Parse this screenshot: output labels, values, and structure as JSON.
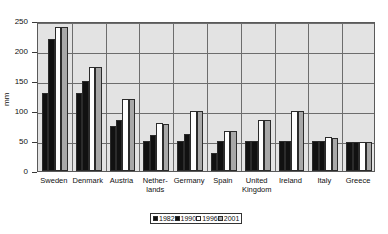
{
  "chart_data": {
    "type": "bar",
    "title": "",
    "xlabel": "",
    "ylabel": "mm",
    "ylim": [
      0,
      250
    ],
    "yticks": [
      0,
      50,
      100,
      150,
      200,
      250
    ],
    "grid": true,
    "legend_position": "bottom",
    "categories": [
      "Sweden",
      "Denmark",
      "Austria",
      "Netherlands",
      "Germany",
      "Spain",
      "United Kingdom",
      "Ireland",
      "Italy",
      "Greece"
    ],
    "category_labels": [
      [
        "Sweden"
      ],
      [
        "Denmark"
      ],
      [
        "Austria"
      ],
      [
        "Nether-",
        "lands"
      ],
      [
        "Germany"
      ],
      [
        "Spain"
      ],
      [
        "United",
        "Kingdom"
      ],
      [
        "Ireland"
      ],
      [
        "Italy"
      ],
      [
        "Greece"
      ]
    ],
    "series": [
      {
        "name": "1982",
        "color": "#111111",
        "values": [
          130,
          130,
          75,
          50,
          50,
          30,
          50,
          50,
          50,
          48
        ]
      },
      {
        "name": "1990",
        "color": "#111111",
        "values": [
          220,
          150,
          85,
          60,
          62,
          50,
          50,
          50,
          50,
          48
        ]
      },
      {
        "name": "1996",
        "color": "#ffffff",
        "values": [
          240,
          173,
          120,
          80,
          100,
          67,
          85,
          100,
          57,
          48
        ]
      },
      {
        "name": "2001",
        "color": "#a8a8a8",
        "values": [
          240,
          173,
          120,
          78,
          100,
          67,
          85,
          100,
          55,
          48
        ]
      }
    ]
  },
  "legend": {
    "entries": [
      {
        "label": "1982",
        "color": "#111111"
      },
      {
        "label": "1990",
        "color": "#111111"
      },
      {
        "label": "1996",
        "color": "#ffffff"
      },
      {
        "label": "2001",
        "color": "#a8a8a8"
      }
    ]
  },
  "colors": {
    "plot_background": "#e3e3e3",
    "gridline": "#6d6d6d",
    "axis": "#3a3a3a",
    "text": "#111111"
  }
}
